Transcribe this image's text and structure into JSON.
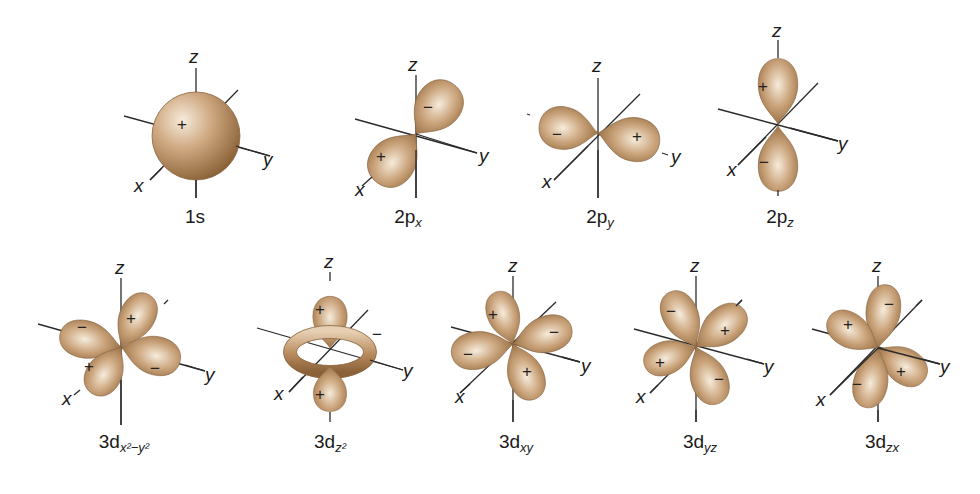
{
  "figure": {
    "background": "#ffffff",
    "lobe_colors": {
      "highlight": "#f3e6d2",
      "mid": "#c9a27a",
      "shadow": "#8c6338"
    },
    "axis_labels": {
      "x": "x",
      "y": "y",
      "z": "z"
    },
    "orbitals": [
      {
        "id": "1s",
        "main": "1s",
        "sub": "",
        "signs": [
          "+"
        ],
        "row": 1
      },
      {
        "id": "2px",
        "main": "2p",
        "sub": "x",
        "signs": [
          "+",
          "−"
        ],
        "row": 1
      },
      {
        "id": "2py",
        "main": "2p",
        "sub": "y",
        "signs": [
          "−",
          "+"
        ],
        "row": 1
      },
      {
        "id": "2pz",
        "main": "2p",
        "sub": "z",
        "signs": [
          "+",
          "−"
        ],
        "row": 1
      },
      {
        "id": "3dx2y2",
        "main": "3d",
        "sub": "x²−y²",
        "signs": [
          "−",
          "+",
          "+",
          "−"
        ],
        "row": 2
      },
      {
        "id": "3dz2",
        "main": "3d",
        "sub": "z²",
        "signs": [
          "+",
          "−",
          "+"
        ],
        "row": 2
      },
      {
        "id": "3dxy",
        "main": "3d",
        "sub": "xy",
        "signs": [
          "+",
          "−",
          "−",
          "+"
        ],
        "row": 2
      },
      {
        "id": "3dyz",
        "main": "3d",
        "sub": "yz",
        "signs": [
          "−",
          "+",
          "+",
          "−"
        ],
        "row": 2
      },
      {
        "id": "3dzx",
        "main": "3d",
        "sub": "zx",
        "signs": [
          "+",
          "−",
          "−",
          "+"
        ],
        "row": 2
      }
    ]
  }
}
